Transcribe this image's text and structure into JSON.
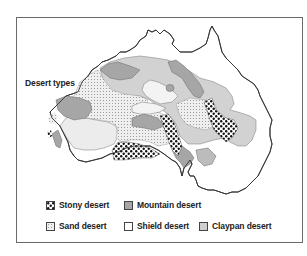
{
  "map": {
    "title": "Desert types",
    "region": "Australia",
    "legend": [
      {
        "id": "stony",
        "label": "Stony desert",
        "pattern": "large-dots",
        "color": "#ffffff",
        "dot_color": "#111111"
      },
      {
        "id": "mountain",
        "label": "Mountain desert",
        "pattern": "solid",
        "color": "#a6a6a6"
      },
      {
        "id": "sand",
        "label": "Sand desert",
        "pattern": "fine-dots",
        "color": "#eeeeee",
        "dot_color": "#9a9a9a"
      },
      {
        "id": "shield",
        "label": "Shield desert",
        "pattern": "solid",
        "color": "#ffffff"
      },
      {
        "id": "claypan",
        "label": "Claypan desert",
        "pattern": "solid",
        "color": "#d0d0d0"
      }
    ],
    "colors": {
      "frame": "#6a6a6a",
      "coastline": "#333333",
      "shield_region": "#ececec"
    }
  }
}
